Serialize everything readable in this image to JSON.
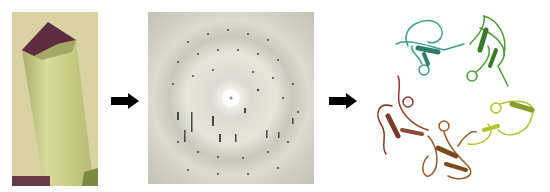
{
  "figure": {
    "steps": [
      {
        "name": "crystal",
        "label": "Protein crystal"
      },
      {
        "name": "diffraction-pattern",
        "label": "X-ray diffraction pattern"
      },
      {
        "name": "protein-structure",
        "label": "Protein ribbon structure"
      }
    ],
    "arrows": [
      "arrow-right",
      "arrow-right"
    ],
    "colors": {
      "crystal_bg": "#d9d3a4",
      "crystal_body": "#c9cf8a",
      "crystal_tip": "#5a2a3a",
      "diffraction_bg": "#d6d5ca",
      "arrow": "#000000",
      "protein_teal": "#3f9c86",
      "protein_green": "#4e9a3a",
      "protein_yellowgreen": "#b4c230",
      "protein_brown": "#9a5a2a",
      "protein_redbrown": "#8a3a2a"
    }
  }
}
